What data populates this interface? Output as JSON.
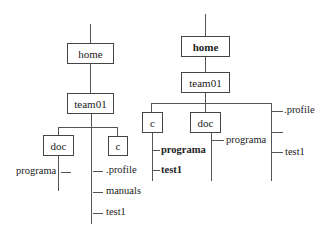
{
  "left_tree": {
    "root": "home",
    "level1": "team01",
    "dirs": [
      "doc",
      "c"
    ],
    "doc_children": [
      "programa"
    ],
    "team01_files": [
      ".profile",
      "manuals",
      "test1"
    ]
  },
  "right_tree": {
    "root": "home",
    "level1": "team01",
    "dirs": [
      "c",
      "doc"
    ],
    "c_children": [
      "programa",
      "test1"
    ],
    "doc_children": [
      "programa"
    ],
    "team01_files": [
      ".profile",
      "",
      "test1"
    ]
  },
  "colors": {
    "line": "#555555",
    "text": "#222222",
    "background": "#ffffff"
  }
}
